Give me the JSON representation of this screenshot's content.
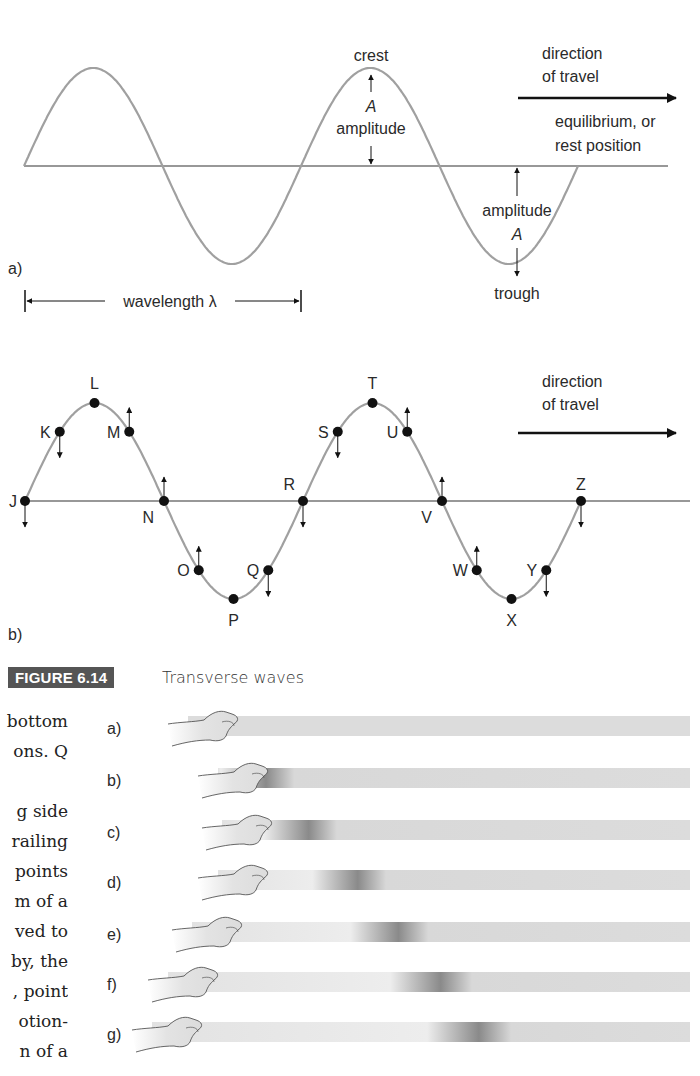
{
  "panel_a": {
    "label": "a)",
    "crest": "crest",
    "trough": "trough",
    "amplitude_top_symbol": "A",
    "amplitude_top_word": "amplitude",
    "amplitude_bottom_word": "amplitude",
    "amplitude_bottom_symbol": "A",
    "direction_line1": "direction",
    "direction_line2": "of travel",
    "equilibrium_line1": "equilibrium, or",
    "equilibrium_line2": "rest position",
    "wavelength": "wavelength λ"
  },
  "panel_b": {
    "label": "b)",
    "direction_line1": "direction",
    "direction_line2": "of travel",
    "points": [
      {
        "name": "J",
        "phase": 0,
        "arrow": "down"
      },
      {
        "name": "K",
        "phase": 0.125,
        "arrow": "down"
      },
      {
        "name": "L",
        "phase": 0.25,
        "arrow": "none"
      },
      {
        "name": "M",
        "phase": 0.375,
        "arrow": "up"
      },
      {
        "name": "N",
        "phase": 0.5,
        "arrow": "up"
      },
      {
        "name": "O",
        "phase": 0.625,
        "arrow": "up"
      },
      {
        "name": "P",
        "phase": 0.75,
        "arrow": "none"
      },
      {
        "name": "Q",
        "phase": 0.875,
        "arrow": "down"
      },
      {
        "name": "R",
        "phase": 1.0,
        "arrow": "down"
      },
      {
        "name": "S",
        "phase": 1.125,
        "arrow": "down"
      },
      {
        "name": "T",
        "phase": 1.25,
        "arrow": "none"
      },
      {
        "name": "U",
        "phase": 1.375,
        "arrow": "up"
      },
      {
        "name": "V",
        "phase": 1.5,
        "arrow": "up"
      },
      {
        "name": "W",
        "phase": 1.625,
        "arrow": "up"
      },
      {
        "name": "X",
        "phase": 1.75,
        "arrow": "none"
      },
      {
        "name": "Y",
        "phase": 1.875,
        "arrow": "down"
      },
      {
        "name": "Z",
        "phase": 2.0,
        "arrow": "down"
      }
    ]
  },
  "caption": {
    "number": "FIGURE 6.14",
    "title": "Transverse waves"
  },
  "body_text_fragments": [
    "bottom",
    "ons. Q",
    "",
    "g side",
    "railing",
    "points",
    "m of a",
    "ved to",
    "by, the",
    ", point",
    "otion-",
    "n of a"
  ],
  "pulse_rows": [
    {
      "label": "a)",
      "pulse_position": null
    },
    {
      "label": "b)",
      "pulse_position": 0.0
    },
    {
      "label": "c)",
      "pulse_position": 0.15
    },
    {
      "label": "d)",
      "pulse_position": 0.35
    },
    {
      "label": "e)",
      "pulse_position": 0.55
    },
    {
      "label": "f)",
      "pulse_position": 0.72
    },
    {
      "label": "g)",
      "pulse_position": 0.85
    }
  ],
  "colors": {
    "wave": "#a0a0a0",
    "ink": "#111111",
    "caption_bg": "#555555",
    "spring": "#dcdcdc",
    "pulse": "#8a8a8a"
  }
}
